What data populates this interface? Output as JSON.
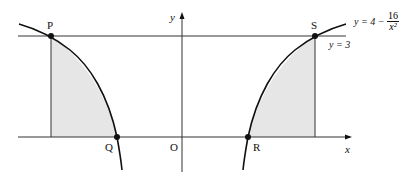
{
  "diagram": {
    "points": [
      {
        "name": "P",
        "x": -4,
        "y": 3
      },
      {
        "name": "S",
        "x": 4,
        "y": 3
      },
      {
        "name": "Q",
        "x": -2,
        "y": 0
      },
      {
        "name": "R",
        "x": 2,
        "y": 0
      }
    ],
    "origin_label": "O",
    "x_axis_label": "x",
    "y_axis_label": "y",
    "curve_label": {
      "prefix": "y = 4 −",
      "numerator": "16",
      "denominator": "x²"
    },
    "line_label": "y = 3",
    "shaded_regions": [
      "between x=-4 and x=-2 under curve",
      "between x=2 and x=4 under curve"
    ],
    "colors": {
      "shade": "#e8e8e8",
      "line": "#111111"
    }
  }
}
